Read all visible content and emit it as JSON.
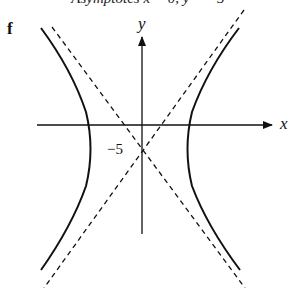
{
  "caption": "Asymptotes x = 0, y = −5",
  "part_label": "f",
  "axes": {
    "x_label": "x",
    "y_label": "y"
  },
  "annotations": {
    "y_intercept_label": "−5"
  },
  "curve": {
    "type": "hyperbola",
    "orientation": "horizontal",
    "center": [
      0,
      -5
    ],
    "asymptotes": "two dashed lines crossing at (0, −5)"
  },
  "colors": {
    "ink": "#111111",
    "background": "#ffffff"
  }
}
